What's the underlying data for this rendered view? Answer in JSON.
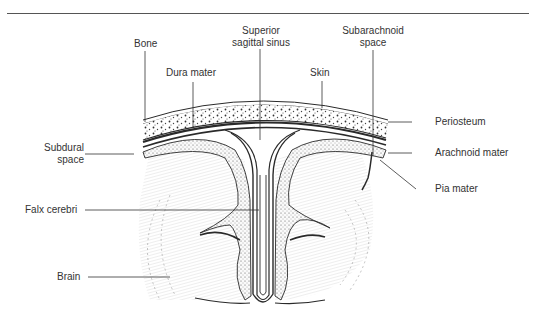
{
  "diagram": {
    "colors": {
      "ink": "#2a2a2a",
      "label": "#333333",
      "rule": "#555555",
      "hatch": "#c8c8c8"
    },
    "labels": {
      "bone": "Bone",
      "superior_sagittal_sinus_1": "Superior",
      "superior_sagittal_sinus_2": "sagittal sinus",
      "subarachnoid_space_1": "Subarachnoid",
      "subarachnoid_space_2": "space",
      "dura_mater": "Dura mater",
      "skin": "Skin",
      "periosteum": "Periosteum",
      "subdural_space_1": "Subdural",
      "subdural_space_2": "space",
      "arachnoid_mater": "Arachnoid mater",
      "pia_mater": "Pia mater",
      "falx_cerebri": "Falx cerebri",
      "brain": "Brain"
    }
  }
}
